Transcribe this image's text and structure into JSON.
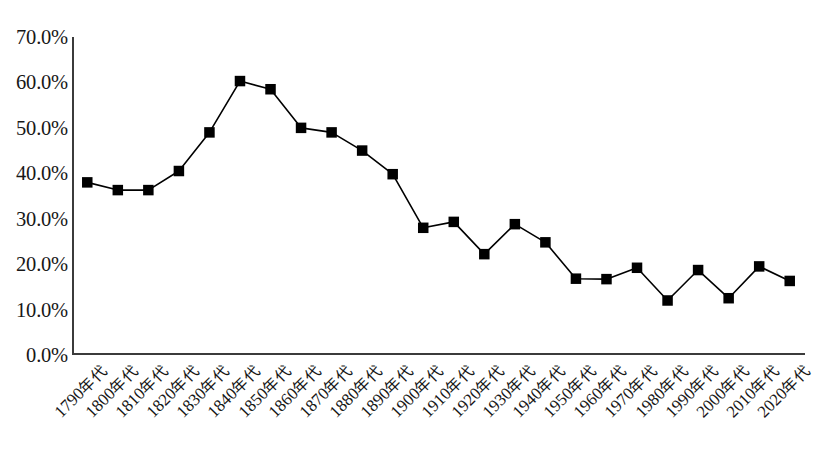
{
  "chart_data": {
    "type": "line",
    "title": "",
    "subtitle": "",
    "xlabel": "",
    "ylabel": "",
    "ylim": [
      0,
      70
    ],
    "ytick_labels": [
      "70.0%",
      "60.0%",
      "50.0%",
      "40.0%",
      "30.0%",
      "20.0%",
      "10.0%",
      "0.0%"
    ],
    "ytick_values": [
      70,
      60,
      50,
      40,
      30,
      20,
      10,
      0
    ],
    "ytick_step": 10,
    "grid": false,
    "legend": null,
    "marker": "square",
    "marker_color": "#000000",
    "line_color": "#000000",
    "axis_color": "#3b3b3b",
    "categories": [
      "1790年代",
      "1800年代",
      "1810年代",
      "1820年代",
      "1830年代",
      "1840年代",
      "1850年代",
      "1860年代",
      "1870年代",
      "1880年代",
      "1890年代",
      "1900年代",
      "1910年代",
      "1920年代",
      "1930年代",
      "1940年代",
      "1950年代",
      "1960年代",
      "1970年代",
      "1980年代",
      "1990年代",
      "2000年代",
      "2010年代",
      "2020年代"
    ],
    "values": [
      38.0,
      36.3,
      36.3,
      40.5,
      49.0,
      60.3,
      58.5,
      50.0,
      49.0,
      45.0,
      39.8,
      28.0,
      29.3,
      22.2,
      28.8,
      24.8,
      16.8,
      16.7,
      19.2,
      12.0,
      18.7,
      12.5,
      19.5,
      16.3
    ],
    "value_labels": [
      "38.0%",
      "36.3%",
      "36.3%",
      "40.5%",
      "49.0%",
      "60.3%",
      "58.5%",
      "50.0%",
      "49.0%",
      "45.0%",
      "39.8%",
      "28.0%",
      "29.3%",
      "22.2%",
      "28.8%",
      "24.8%",
      "16.8%",
      "16.7%",
      "19.2%",
      "12.0%",
      "18.7%",
      "12.5%",
      "19.5%",
      "16.3%"
    ]
  }
}
